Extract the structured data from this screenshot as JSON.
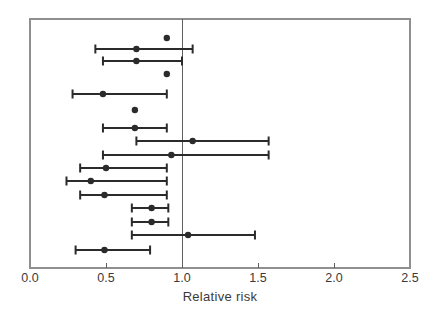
{
  "figure": {
    "background": "#ffffff"
  },
  "chart_data": {
    "type": "scatter",
    "subtype": "forest-plot",
    "title": "",
    "xlabel": "Relative risk",
    "ylabel": "",
    "xlim": [
      0.0,
      2.5
    ],
    "x_ticks": [
      0.0,
      0.5,
      1.0,
      1.5,
      2.0,
      2.5
    ],
    "x_tick_labels": [
      "0.0",
      "0.5",
      "1.0",
      "1.5",
      "2.0",
      "2.5"
    ],
    "reference_line_x": 1.0,
    "grid": false,
    "legend": "none",
    "studies": [
      {
        "estimate": 0.9,
        "lower": null,
        "upper": null
      },
      {
        "estimate": 0.7,
        "lower": 0.43,
        "upper": 1.07
      },
      {
        "estimate": 0.7,
        "lower": 0.48,
        "upper": 1.0
      },
      {
        "estimate": 0.9,
        "lower": null,
        "upper": null
      },
      {
        "estimate": 0.48,
        "lower": 0.28,
        "upper": 0.9
      },
      {
        "estimate": 0.69,
        "lower": null,
        "upper": null
      },
      {
        "estimate": 0.69,
        "lower": 0.48,
        "upper": 0.9
      },
      {
        "estimate": 1.07,
        "lower": 0.7,
        "upper": 1.57
      },
      {
        "estimate": 0.93,
        "lower": 0.48,
        "upper": 1.57
      },
      {
        "estimate": 0.5,
        "lower": 0.33,
        "upper": 0.9
      },
      {
        "estimate": 0.4,
        "lower": 0.24,
        "upper": 0.9
      },
      {
        "estimate": 0.49,
        "lower": 0.33,
        "upper": 0.9
      },
      {
        "estimate": 0.8,
        "lower": 0.67,
        "upper": 0.91
      },
      {
        "estimate": 0.8,
        "lower": 0.67,
        "upper": 0.91
      },
      {
        "estimate": 1.04,
        "lower": 0.67,
        "upper": 1.48
      },
      {
        "estimate": 0.49,
        "lower": 0.3,
        "upper": 0.79
      }
    ],
    "row_y_px": [
      38,
      49,
      61,
      74,
      94,
      110,
      128,
      141,
      155,
      168,
      181,
      195,
      208,
      222,
      235,
      250
    ],
    "colors": {
      "marker": "#2b2b2b",
      "error_bar": "#2b2b2b",
      "frame": "#8f8f8f",
      "reference_line": "#5f5f5f",
      "tick": "#5f5f5f",
      "tick_label": "#3a3a3a",
      "axis_title": "#3a3a3a",
      "background": "#ffffff"
    },
    "layout": {
      "plot_left": 30,
      "plot_right": 410,
      "plot_top": 19,
      "plot_bottom": 268,
      "tick_length": 5,
      "tick_label_y": 282,
      "marker_radius": 3.2,
      "bar_thickness": 2,
      "cap_height": 9
    }
  }
}
